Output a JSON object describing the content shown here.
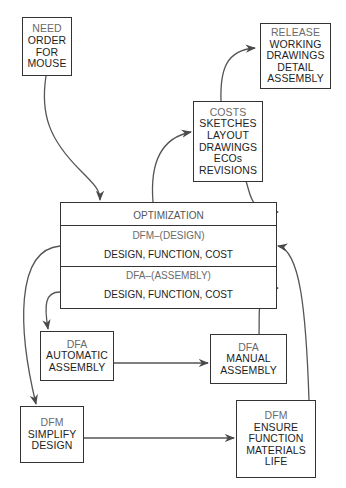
{
  "diagram": {
    "nodes": {
      "need": {
        "lines": [
          "NEED",
          "ORDER",
          "FOR",
          "MOUSE"
        ]
      },
      "release": {
        "lines": [
          "RELEASE",
          "WORKING",
          "DRAWINGS",
          "DETAIL",
          "ASSEMBLY"
        ]
      },
      "costs": {
        "lines": [
          "COSTS",
          "SKETCHES",
          "LAYOUT",
          "DRAWINGS",
          "ECOs",
          "REVISIONS"
        ]
      },
      "optimization": {
        "title": "OPTIMIZATION",
        "dfm_header": "DFM–(DESIGN)",
        "dfm_body": "DESIGN, FUNCTION, COST",
        "dfa_header": "DFA–(ASSEMBLY)",
        "dfa_body": "DESIGN, FUNCTION, COST"
      },
      "dfa_automatic": {
        "label": "DFA",
        "lines": [
          "AUTOMATIC",
          "ASSEMBLY"
        ]
      },
      "dfa_manual": {
        "label": "DFA",
        "lines": [
          "MANUAL",
          "ASSEMBLY"
        ]
      },
      "dfm_simplify": {
        "label": "DFM",
        "lines": [
          "SIMPLIFY",
          "DESIGN"
        ]
      },
      "dfm_ensure": {
        "label": "DFM",
        "lines": [
          "ENSURE",
          "FUNCTION",
          "MATERIALS",
          "LIFE"
        ]
      }
    },
    "edges": [
      {
        "from": "need",
        "to": "optimization"
      },
      {
        "from": "optimization",
        "to": "costs"
      },
      {
        "from": "costs",
        "to": "release"
      },
      {
        "from": "costs",
        "to": "optimization"
      },
      {
        "from": "optimization.dfm",
        "to": "dfm_simplify"
      },
      {
        "from": "optimization.dfa",
        "to": "dfa_automatic"
      },
      {
        "from": "dfa_automatic",
        "to": "dfa_manual"
      },
      {
        "from": "dfa_manual",
        "to": "optimization.dfa"
      },
      {
        "from": "dfm_simplify",
        "to": "dfm_ensure"
      },
      {
        "from": "dfm_ensure",
        "to": "optimization.dfm"
      }
    ],
    "colors": {
      "line": "#4a4a4a",
      "border": "#333333",
      "sub_text": "#6a6a6a"
    }
  }
}
